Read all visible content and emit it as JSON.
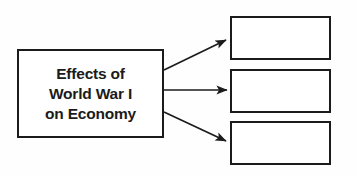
{
  "diagram": {
    "type": "graphic-organizer",
    "orientation": "left-to-right",
    "background_color": "#fefefe",
    "line_color": "#1b1b1b",
    "text_color": "#1b1b1b",
    "source": {
      "label": "Effects of\nWorld War I\non Economy",
      "lines": [
        "Effects of",
        "World War I",
        "on Economy"
      ]
    },
    "effects": [
      {
        "label": ""
      },
      {
        "label": ""
      },
      {
        "label": ""
      }
    ],
    "connectors": [
      {
        "name": "arrow-to-effect-1",
        "direction": "up-right"
      },
      {
        "name": "arrow-to-effect-2",
        "direction": "right"
      },
      {
        "name": "arrow-to-effect-3",
        "direction": "down-right"
      }
    ]
  }
}
